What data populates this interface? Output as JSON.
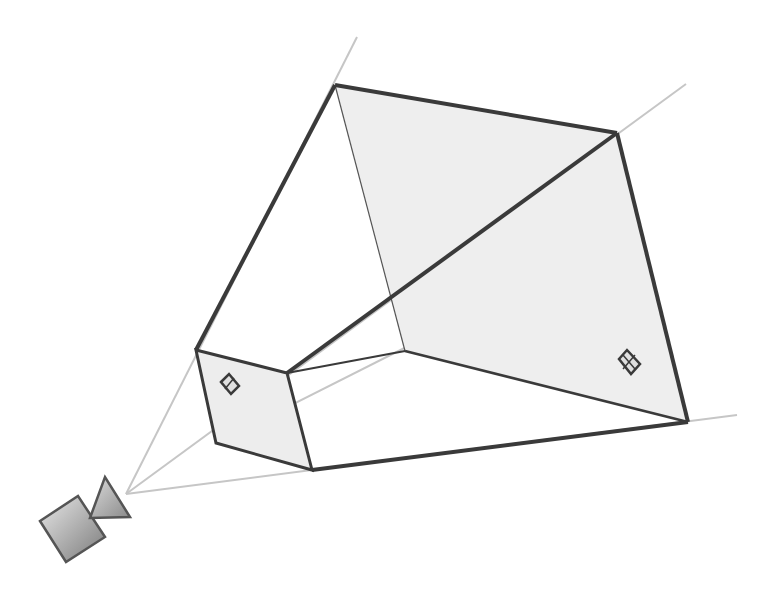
{
  "diagram": {
    "colors": {
      "edge": "#3a3a3a",
      "ray": "#c4c4c4",
      "plane_fill": "#ececec",
      "camera_light": "#e6e6e6",
      "camera_dark": "#7a7a7a"
    },
    "camera": {
      "label": "camera",
      "apex": [
        126,
        494
      ]
    },
    "near_plane": {
      "label": "near clipping plane",
      "corners": [
        [
          196,
          350
        ],
        [
          287,
          373
        ],
        [
          312,
          470
        ],
        [
          216,
          443
        ]
      ],
      "marker": "center-marker"
    },
    "far_plane": {
      "label": "far clipping plane",
      "corners": [
        [
          335,
          85
        ],
        [
          617,
          133
        ],
        [
          688,
          422
        ],
        [
          405,
          351
        ]
      ],
      "marker": "center-marker"
    },
    "rays": [
      {
        "from": [
          126,
          494
        ],
        "to": [
          357,
          37
        ]
      },
      {
        "from": [
          126,
          494
        ],
        "to": [
          686,
          84
        ]
      },
      {
        "from": [
          126,
          494
        ],
        "to": [
          737,
          415
        ]
      },
      {
        "from": [
          126,
          494
        ],
        "to": [
          450,
          325
        ]
      }
    ]
  }
}
